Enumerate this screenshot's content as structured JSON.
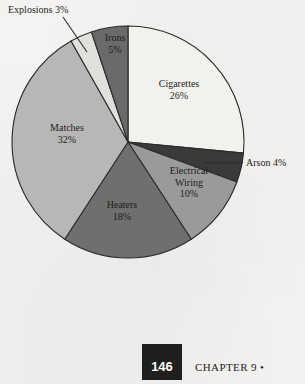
{
  "chart_data": {
    "type": "pie",
    "title": "",
    "subtitle": "",
    "xlabel": "",
    "ylabel": "",
    "legend_position": "none",
    "grid": false,
    "start_angle_deg": 0,
    "direction": "clockwise",
    "units": "percent",
    "total": 98,
    "categories": [
      "Cigarettes",
      "Arson",
      "Electrical Wiring",
      "Heaters",
      "Matches",
      "Explosions",
      "Irons"
    ],
    "values": [
      26,
      4,
      10,
      18,
      32,
      3,
      5
    ],
    "slices": [
      {
        "name": "Cigarettes",
        "label": "Cigarettes",
        "percent": 26,
        "percent_text": "26%",
        "color": "#f3f1ed",
        "label_placement": "inside"
      },
      {
        "name": "Arson",
        "label": "Arson 4%",
        "percent": 4,
        "percent_text": "4%",
        "color": "#3a3a3a",
        "label_placement": "callout"
      },
      {
        "name": "Electrical Wiring",
        "label": "Electrical Wiring",
        "label_line1": "Electrical",
        "label_line2": "Wiring",
        "percent": 10,
        "percent_text": "10%",
        "color": "#9a9a9a",
        "label_placement": "inside"
      },
      {
        "name": "Heaters",
        "label": "Heaters",
        "percent": 18,
        "percent_text": "18%",
        "color": "#6f6f6f",
        "label_placement": "inside"
      },
      {
        "name": "Matches",
        "label": "Matches",
        "percent": 32,
        "percent_text": "32%",
        "color": "#b7b7b7",
        "label_placement": "inside"
      },
      {
        "name": "Explosions",
        "label": "Explosions 3%",
        "percent": 3,
        "percent_text": "3%",
        "color": "#e2e0dc",
        "label_placement": "callout"
      },
      {
        "name": "Irons",
        "label": "Irons",
        "percent": 5,
        "percent_text": "5%",
        "color": "#6a6a6a",
        "label_placement": "inside"
      }
    ]
  },
  "labels": {
    "cigarettes_name": "Cigarettes",
    "cigarettes_pct": "26%",
    "matches_name": "Matches",
    "matches_pct": "32%",
    "heaters_name": "Heaters",
    "heaters_pct": "18%",
    "electrical_line1": "Electrical",
    "electrical_line2": "Wiring",
    "electrical_pct": "10%",
    "irons_name": "Irons",
    "irons_pct": "5%",
    "explosions_callout": "Explosions 3%",
    "arson_callout": "Arson 4%"
  },
  "footer": {
    "page_number": "146",
    "chapter_text": "CHAPTER 9 •"
  },
  "colors": {
    "page_background": "#f4f3f1",
    "ink": "#1d1d1d",
    "outline": "#2a2a2a",
    "footer_box": "#201f1d",
    "footer_number_text": "#ffffff"
  }
}
